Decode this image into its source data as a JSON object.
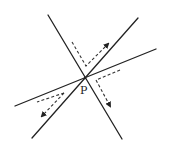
{
  "diagram": {
    "type": "line-intersection-reflection",
    "point_label": "P",
    "point": [
      85,
      78
    ],
    "colors": {
      "line": "#222222",
      "dash": "#333333",
      "background": "#ffffff"
    },
    "lines": [
      {
        "id": "line-a",
        "x1": 48,
        "y1": 15,
        "x2": 122,
        "y2": 139
      },
      {
        "id": "line-b",
        "x1": 138,
        "y1": 18,
        "x2": 32,
        "y2": 138
      },
      {
        "id": "line-c",
        "x1": 156,
        "y1": 49,
        "x2": 15,
        "y2": 106
      }
    ],
    "dashed_paths": [
      {
        "id": "path-upper",
        "d": "M72 42 L86 66 L108 44",
        "arrow": "upper-arrow"
      },
      {
        "id": "path-right",
        "d": "M120 70 L96 80 L110 106",
        "arrow": "right-arrow"
      },
      {
        "id": "path-lower-left-1",
        "d": "M64 93 L37 102",
        "arrow": null
      },
      {
        "id": "path-lower-left-2",
        "d": "M64 93 L42 116",
        "arrow": "lower-left-arrow"
      }
    ]
  }
}
